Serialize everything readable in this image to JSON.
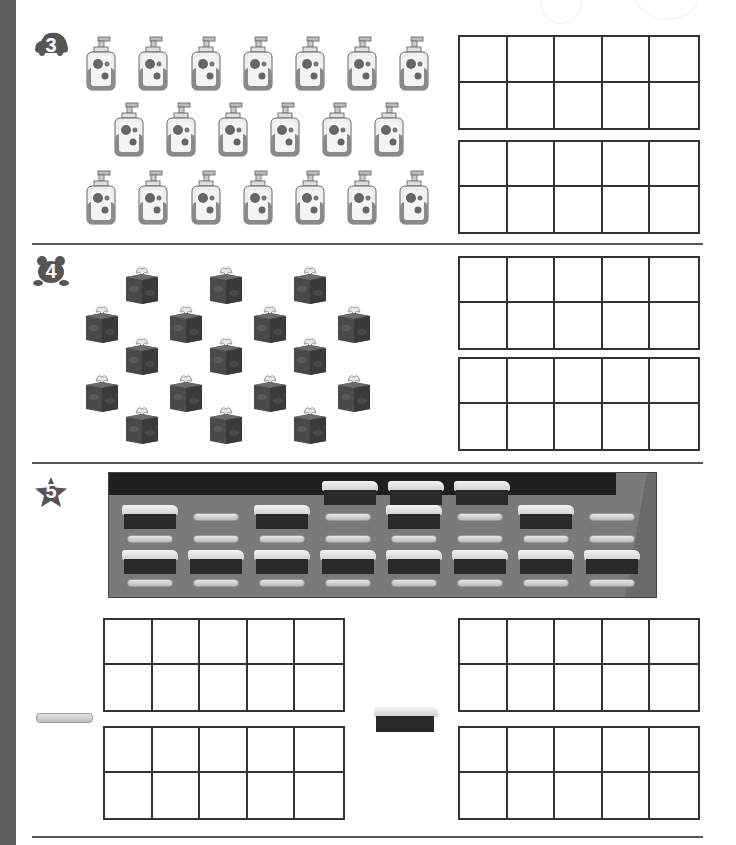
{
  "worksheet": {
    "sections": [
      {
        "number": "3",
        "badge_shape": "car-icon",
        "object": "soap-dispenser",
        "rows": [
          7,
          6,
          7
        ],
        "ten_frames": 2
      },
      {
        "number": "4",
        "badge_shape": "frog-icon",
        "object": "tissue-box",
        "count": 20,
        "ten_frames": 2
      },
      {
        "number": "5",
        "badge_shape": "star-icon",
        "object": "chalkboard-tray",
        "contents": {
          "erasers": 11,
          "chalk_sticks": 13
        },
        "legend": [
          {
            "icon": "chalk-icon",
            "ten_frames": 2
          },
          {
            "icon": "eraser-icon",
            "ten_frames": 2
          }
        ]
      }
    ]
  },
  "colors": {
    "sidebar": "#5f5f5f",
    "badge": "#555555",
    "frame_line": "#333333"
  }
}
